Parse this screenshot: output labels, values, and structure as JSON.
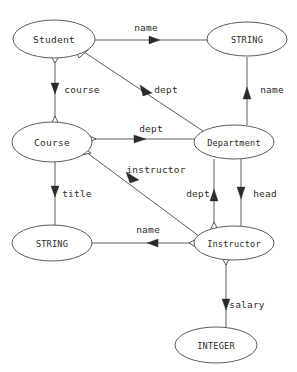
{
  "diagram": {
    "type": "entity-relationship-graph",
    "title": "",
    "background_color": "#ffffff",
    "node_stroke_color": "#5b5b66",
    "text_color": "#2b2b2b",
    "nodes": [
      {
        "id": "student",
        "label": "Student",
        "cx": 54,
        "cy": 39,
        "rx": 41,
        "ry": 19,
        "kind": "entity"
      },
      {
        "id": "string_top",
        "label": "STRING",
        "cx": 247,
        "cy": 39,
        "rx": 40,
        "ry": 17,
        "kind": "type"
      },
      {
        "id": "course",
        "label": "Course",
        "cx": 52,
        "cy": 142,
        "rx": 40,
        "ry": 20,
        "kind": "entity"
      },
      {
        "id": "department",
        "label": "Department",
        "cx": 234,
        "cy": 142,
        "rx": 40,
        "ry": 17,
        "kind": "entity"
      },
      {
        "id": "string_left",
        "label": "STRING",
        "cx": 52,
        "cy": 243,
        "rx": 40,
        "ry": 18,
        "kind": "type"
      },
      {
        "id": "instructor",
        "label": "Instructor",
        "cx": 234,
        "cy": 243,
        "rx": 40,
        "ry": 17,
        "kind": "entity"
      },
      {
        "id": "integer",
        "label": "INTEGER",
        "cx": 216,
        "cy": 345,
        "rx": 41,
        "ry": 18,
        "kind": "type"
      }
    ],
    "edges": [
      {
        "id": "student-name",
        "label": "name",
        "from": "student",
        "to": "string_top",
        "label_x": 146,
        "label_y": 28
      },
      {
        "id": "student-course",
        "label": "course",
        "from": "student",
        "to": "course",
        "label_x": 82,
        "label_y": 90
      },
      {
        "id": "student-dept",
        "label": "dept",
        "from": "student",
        "to": "department",
        "label_x": 166,
        "label_y": 90
      },
      {
        "id": "department-name",
        "label": "name",
        "from": "department",
        "to": "string_top",
        "label_x": 272,
        "label_y": 90
      },
      {
        "id": "course-dept",
        "label": "dept",
        "from": "course",
        "to": "department",
        "label_x": 151,
        "label_y": 129
      },
      {
        "id": "course-instructor",
        "label": "instructor",
        "from": "course",
        "to": "instructor",
        "label_x": 156,
        "label_y": 170
      },
      {
        "id": "course-title",
        "label": "title",
        "from": "course",
        "to": "string_left",
        "label_x": 77,
        "label_y": 194
      },
      {
        "id": "instructor-dept",
        "label": "dept",
        "from": "instructor",
        "to": "department",
        "label_x": 198,
        "label_y": 194
      },
      {
        "id": "department-head",
        "label": "head",
        "from": "department",
        "to": "instructor",
        "label_x": 265,
        "label_y": 194
      },
      {
        "id": "instructor-name",
        "label": "name",
        "from": "instructor",
        "to": "string_left",
        "label_x": 148,
        "label_y": 230
      },
      {
        "id": "instructor-salary",
        "label": "salary",
        "from": "instructor",
        "to": "integer",
        "label_x": 247,
        "label_y": 305
      }
    ]
  }
}
